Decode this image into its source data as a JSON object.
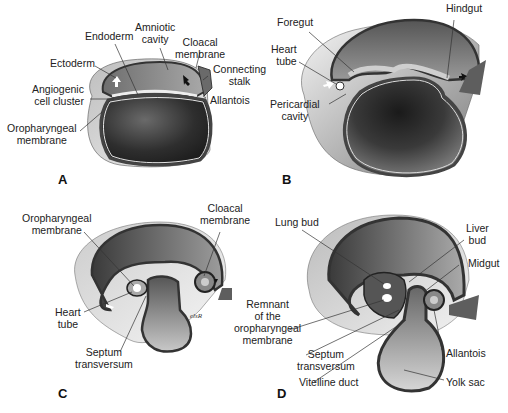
{
  "figure": {
    "panels": [
      {
        "id": "A",
        "letter": "A",
        "labels": {
          "ectoderm": "Ectoderm",
          "endoderm": "Endoderm",
          "amniotic_cavity": "Amniotic\ncavity",
          "cloacal_membrane": "Cloacal\nmembrane",
          "connecting_stalk": "Connecting\nstalk",
          "angiogenic_cell_cluster": "Angiogenic\ncell cluster",
          "allantois": "Allantois",
          "oropharyngeal_membrane": "Oropharyngeal\nmembrane"
        }
      },
      {
        "id": "B",
        "letter": "B",
        "labels": {
          "foregut": "Foregut",
          "hindgut": "Hindgut",
          "heart_tube": "Heart\ntube",
          "pericardial_cavity": "Pericardial\ncavity"
        }
      },
      {
        "id": "C",
        "letter": "C",
        "labels": {
          "oropharyngeal_membrane": "Oropharyngeal\nmembrane",
          "cloacal_membrane": "Cloacal\nmembrane",
          "heart_tube": "Heart\ntube",
          "septum_transversum": "Septum\ntransversum",
          "signature": "elsR"
        }
      },
      {
        "id": "D",
        "letter": "D",
        "labels": {
          "lung_bud": "Lung bud",
          "liver_bud": "Liver\nbud",
          "midgut": "Midgut",
          "remnant_oropharyngeal": "Remnant\nof the\noropharyngeal\nmembrane",
          "septum_transversum": "Septum\ntransversum",
          "allantois": "Allantois",
          "vitelline_duct": "Vitelline duct",
          "yolk_sac": "Yolk sac"
        }
      }
    ],
    "colors": {
      "yolk_dark": "#2a2a2a",
      "amnion_mid": "#8a8a8a",
      "outer_light": "#cfcfcf",
      "membrane_light": "#e8e8e8",
      "arrow_white": "#ffffff",
      "arrow_black": "#111111"
    }
  }
}
